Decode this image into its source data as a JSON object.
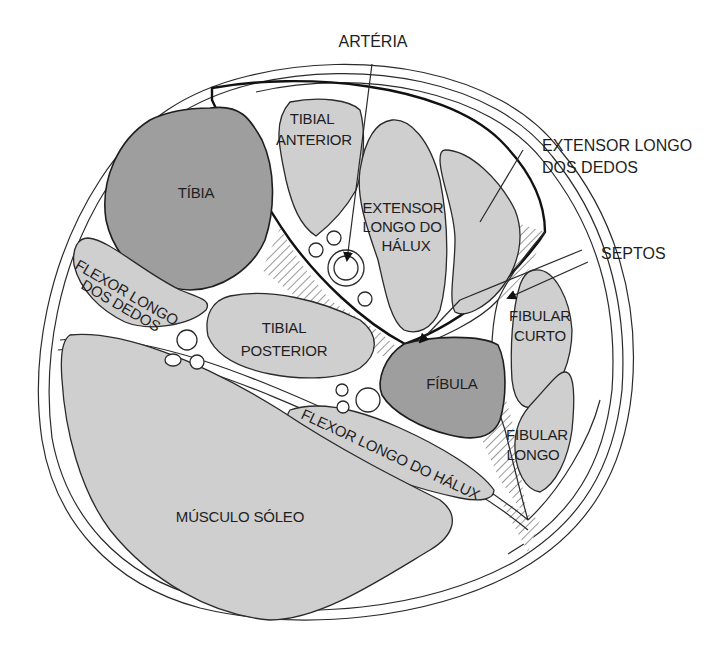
{
  "diagram": {
    "colors": {
      "bone": "#9e9e9e",
      "muscle": "#cfcfcf",
      "outline": "#2a2a2a",
      "background": "#ffffff"
    },
    "external_labels": {
      "arteria": "ARTÉRIA",
      "extensor_longo_dedos_line1": "EXTENSOR LONGO",
      "extensor_longo_dedos_line2": "DOS DEDOS",
      "septos": "SEPTOS"
    },
    "structures": {
      "tibia": "TÍBIA",
      "fibula": "FÍBULA",
      "tibial_anterior_line1": "TIBIAL",
      "tibial_anterior_line2": "ANTERIOR",
      "extensor_longo_halux_line1": "EXTENSOR",
      "extensor_longo_halux_line2": "LONGO DO",
      "extensor_longo_halux_line3": "HÁLUX",
      "flexor_longo_dedos_line1": "FLEXOR LONGO",
      "flexor_longo_dedos_line2": "DOS DEDOS",
      "tibial_posterior_line1": "TIBIAL",
      "tibial_posterior_line2": "POSTERIOR",
      "flexor_longo_halux": "FLEXOR LONGO DO HÁLUX",
      "fibular_curto_line1": "FIBULAR",
      "fibular_curto_line2": "CURTO",
      "fibular_longo_line1": "FIBULAR",
      "fibular_longo_line2": "LONGO",
      "musculo_soleo": "MÚSCULO SÓLEO"
    }
  }
}
